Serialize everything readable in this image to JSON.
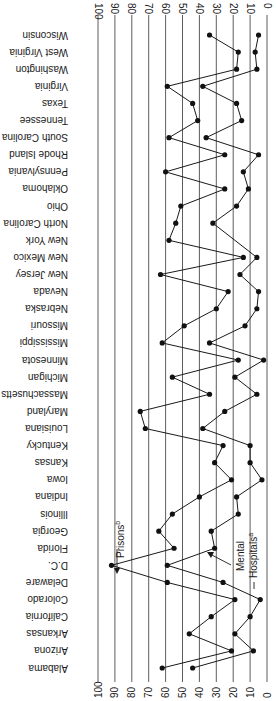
{
  "chart_data": {
    "type": "line",
    "orientation": "rotated-90 (categories along vertical axis, values along horizontal axis, 0 at right, 100 at left; text rendered upside-down)",
    "title": "",
    "xlabel": "",
    "ylabel": "",
    "ylim": [
      0,
      100
    ],
    "value_ticks": [
      100,
      90,
      80,
      70,
      60,
      50,
      40,
      30,
      20,
      10,
      0
    ],
    "grid": true,
    "categories": [
      "Alabama",
      "Arizona",
      "Arkansas",
      "California",
      "Colorado",
      "Delaware",
      "D.C.",
      "Florida",
      "Georgia",
      "Illinois",
      "Indiana",
      "Iowa",
      "Kansas",
      "Kentucky",
      "Louisiana",
      "Maryland",
      "Massachusetts",
      "Michigan",
      "Minnesota",
      "Mississippi",
      "Missouri",
      "Nebraska",
      "Nevada",
      "New Jersey",
      "New Mexico",
      "New York",
      "North Carolina",
      "Ohio",
      "Oklahoma",
      "Pennsylvania",
      "Rhode Island",
      "South Carolina",
      "Tennessee",
      "Texas",
      "Virginia",
      "Washington",
      "West Virginia",
      "Wisconsin"
    ],
    "series": [
      {
        "name": "Prisons",
        "label": "Prisons",
        "superscript": "b",
        "values": [
          62,
          21,
          46,
          33,
          19,
          59,
          92,
          55,
          64,
          56,
          40,
          21,
          31,
          26,
          72,
          75,
          34,
          56,
          17,
          62,
          49,
          30,
          23,
          63,
          14,
          58,
          54,
          51,
          25,
          60,
          25,
          58,
          41,
          44,
          59,
          18,
          17,
          34
        ]
      },
      {
        "name": "Mental Hospitals",
        "label": "Mental Hospitals",
        "superscript": "a",
        "values": [
          44,
          8,
          19,
          10,
          4,
          26,
          59,
          31,
          33,
          17,
          18,
          3,
          10,
          10,
          38,
          25,
          6,
          19,
          2,
          34,
          13,
          6,
          5,
          16,
          6,
          null,
          32,
          18,
          11,
          14,
          5,
          36,
          15,
          18,
          38,
          6,
          7,
          5
        ]
      }
    ],
    "annotations": [
      {
        "text": "Prisons",
        "superscript": "b",
        "points_to": "D.C. (Prisons)"
      },
      {
        "text_line1": "Mental",
        "text_line2": "Hospitals",
        "superscript": "a",
        "points_to": "Florida (Mental Hospitals)"
      }
    ]
  }
}
